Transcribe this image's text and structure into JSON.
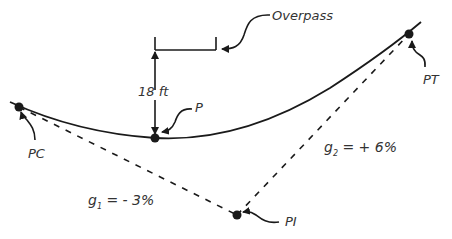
{
  "diagram": {
    "type": "sag vertical curve under overpass",
    "colors": {
      "line": "#1a1a1a",
      "text": "#333333",
      "background": "#ffffff"
    },
    "points": {
      "pc": {
        "label": "PC",
        "x": 19,
        "y": 107
      },
      "p": {
        "label": "P",
        "x": 155,
        "y": 138
      },
      "pi": {
        "label": "PI",
        "x": 237,
        "y": 215
      },
      "pt": {
        "label": "PT",
        "x": 409,
        "y": 34
      }
    },
    "overpass": {
      "label": "Overpass"
    },
    "clearance": {
      "label": "18 ft"
    },
    "grades": {
      "g1": {
        "symbol": "g",
        "subscript": "1",
        "value": " = - 3%"
      },
      "g2": {
        "symbol": "g",
        "subscript": "2",
        "value": " = + 6%"
      }
    }
  }
}
